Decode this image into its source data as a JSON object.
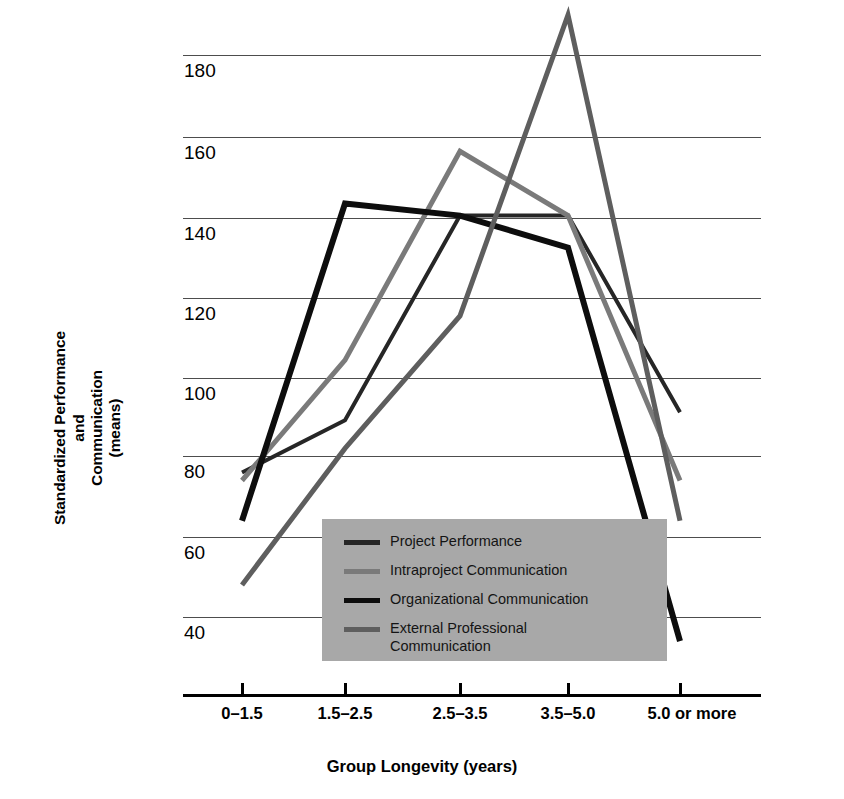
{
  "chart_data": {
    "type": "line",
    "title": "",
    "xlabel": "Group Longevity (years)",
    "ylabel": "Standardized Performance and Communication (means)",
    "ylabel_lines": [
      "Standardized Performance",
      "and",
      "Communication",
      "(means)"
    ],
    "categories": [
      "0–1.5",
      "1.5–2.5",
      "2.5–3.5",
      "3.5–5.0",
      "5.0 or more"
    ],
    "yticks": [
      40,
      60,
      80,
      100,
      120,
      140,
      160,
      180
    ],
    "ylim": [
      28,
      195
    ],
    "grid": true,
    "legend_position": "inside-bottom-center",
    "series": [
      {
        "name": "Project Performance",
        "color": "#262626",
        "width": 4,
        "values": [
          76,
          89,
          140,
          140,
          91
        ]
      },
      {
        "name": "Intraproject Communication",
        "color": "#7a7a7a",
        "width": 5,
        "values": [
          74,
          104,
          156,
          140,
          74
        ]
      },
      {
        "name": "Organizational Communication",
        "color": "#0d0d0d",
        "width": 6,
        "values": [
          64,
          143,
          140,
          132,
          34
        ]
      },
      {
        "name": "External Professional Communication",
        "color": "#5e5e5e",
        "width": 5,
        "values": [
          48,
          82,
          115,
          190,
          64
        ]
      }
    ]
  },
  "axis": {
    "ytick_labels": [
      "180",
      "160",
      "140",
      "120",
      "100",
      "80",
      "60",
      "40"
    ],
    "xtick_labels": [
      "0–1.5",
      "1.5–2.5",
      "2.5–3.5",
      "3.5–5.0",
      "5.0 or more"
    ],
    "x_title": "Group Longevity (years)",
    "y_title_line1": "Standardized Performance",
    "y_title_line2": "and",
    "y_title_line3": "Communication",
    "y_title_line4": "(means)"
  },
  "legend": {
    "background": "#a8a8a8",
    "items": [
      {
        "label": "Project Performance",
        "color": "#262626"
      },
      {
        "label": "Intraproject Communication",
        "color": "#7a7a7a"
      },
      {
        "label": "Organizational Communication",
        "color": "#0d0d0d"
      },
      {
        "label": "External Professional\nCommunication",
        "color": "#5e5e5e"
      }
    ]
  }
}
